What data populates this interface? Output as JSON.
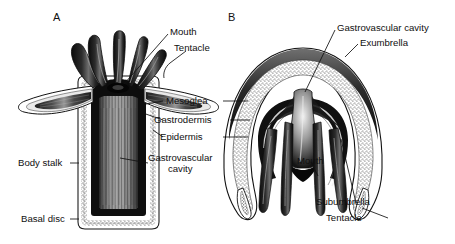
{
  "figure": {
    "panels": [
      {
        "letter": "A",
        "name": "polyp",
        "x": 53,
        "y": 11
      },
      {
        "letter": "B",
        "name": "medusa",
        "x": 228,
        "y": 11
      }
    ]
  },
  "labels": {
    "polyp": {
      "mouth": "Mouth",
      "tentacle": "Tentacle",
      "body_stalk": "Body stalk",
      "basal_disc": "Basal disc"
    },
    "shared": {
      "mesoglea": "Mesoglea",
      "gastrodermis": "Gastrodermis",
      "epidermis": "Epidermis",
      "gastrovascular_cavity_line1": "Gastrovascular",
      "gastrovascular_cavity_line2": "cavity"
    },
    "medusa": {
      "gastrovascular_cavity": "Gastrovascular cavity",
      "exumbrella": "Exumbrella",
      "mouth": "Mouth",
      "subumbrella": "Subumbrella",
      "tentacle": "Tentacle"
    }
  },
  "colors": {
    "ink": "#101010",
    "paper": "#ffffff",
    "mesoglea_stipple": "#c9c9c9",
    "gastrodermis_dark": "#141414",
    "cavity_grey": "#8c8c8c"
  }
}
